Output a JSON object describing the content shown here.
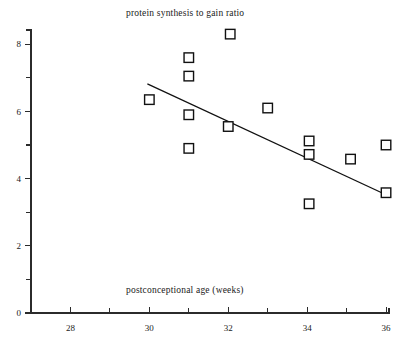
{
  "chart_data": {
    "type": "scatter",
    "title": "protein synthesis to gain ratio",
    "xlabel": "postconceptional age (weeks)",
    "ylabel": "protein synthesis to gain ratio",
    "xlim": [
      27,
      36
    ],
    "ylim": [
      0,
      8.6
    ],
    "grid": false,
    "legend": null,
    "x_ticks_major": [
      28,
      30,
      32,
      34,
      36
    ],
    "x_ticks_minor": [
      29,
      31,
      33,
      35
    ],
    "x_tick_labels": [
      "28",
      "30",
      "32",
      "34",
      "36"
    ],
    "y_ticks_major": [
      0,
      2,
      4,
      6,
      8
    ],
    "y_ticks_minor": [
      1,
      3,
      5,
      7
    ],
    "y_tick_labels": [
      "0",
      "2",
      "4",
      "6",
      "8"
    ],
    "marker": "open-square",
    "points": [
      {
        "x": 30.0,
        "y": 6.35
      },
      {
        "x": 31.0,
        "y": 7.6
      },
      {
        "x": 31.0,
        "y": 7.05
      },
      {
        "x": 31.0,
        "y": 5.9
      },
      {
        "x": 31.0,
        "y": 4.9
      },
      {
        "x": 32.05,
        "y": 8.3
      },
      {
        "x": 32.0,
        "y": 5.55
      },
      {
        "x": 33.0,
        "y": 6.1
      },
      {
        "x": 34.05,
        "y": 5.12
      },
      {
        "x": 34.05,
        "y": 4.72
      },
      {
        "x": 34.05,
        "y": 3.25
      },
      {
        "x": 35.1,
        "y": 4.58
      },
      {
        "x": 36.0,
        "y": 5.0
      },
      {
        "x": 36.0,
        "y": 3.58
      }
    ],
    "fit_line": {
      "label": "regression line",
      "x_start": 29.95,
      "y_start": 6.82,
      "x_end": 36.0,
      "y_end": 3.52
    }
  },
  "annotations": {
    "chart_title_text": "protein synthesis to gain ratio",
    "x_title_text": "postconceptional age (weeks)"
  },
  "colors": {
    "axis": "#2b2b2b",
    "marker_stroke": "#111111",
    "marker_fill": "#ffffff",
    "fit_line": "#111111",
    "background": "#ffffff",
    "text": "#1a1a1a"
  }
}
